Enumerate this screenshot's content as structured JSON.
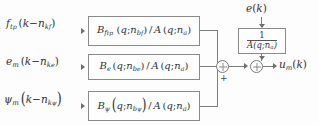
{
  "diagram": {
    "type": "block-diagram",
    "inputs": [
      {
        "name": "force-input",
        "latex": "f_{t_p}(k - n_{k_f})",
        "base": "f",
        "base_sub": "t",
        "base_sub2": "p",
        "arg_open": "(",
        "arg_var": "k",
        "minus": "−",
        "delay": "n",
        "delay_sub": "k",
        "delay_sub2": "f",
        "arg_close": ")"
      },
      {
        "name": "error-input",
        "latex": "e_m(k - n_{k_e})",
        "base": "e",
        "base_sub": "m",
        "base_sub2": "",
        "arg_open": "(",
        "arg_var": "k",
        "minus": "−",
        "delay": "n",
        "delay_sub": "k",
        "delay_sub2": "e",
        "arg_close": ")"
      },
      {
        "name": "psi-input",
        "latex": "ψ_m(k - n_{k_ψ})",
        "base": "ψ",
        "base_sub": "m",
        "base_sub2": "",
        "arg_open": "(",
        "arg_var": "k",
        "minus": "−",
        "delay": "n",
        "delay_sub": "k",
        "delay_sub2": "ψ",
        "arg_close": ")"
      }
    ],
    "blocks": [
      {
        "name": "block-Bf",
        "latex": "B_{f_{t_p}}(q;n_{b_f}) / A(q;n_a)",
        "num": "B",
        "num_sub": "f",
        "num_sub2": "t",
        "num_sub3": "p",
        "nb": "n",
        "nb_sub": "b",
        "nb_sub2": "f",
        "q": "q",
        "semi": ";",
        "slash": "/",
        "den": "A",
        "na": "n",
        "na_sub": "a"
      },
      {
        "name": "block-Be",
        "latex": "B_e(q;n_{b_e}) / A(q;n_a)",
        "num": "B",
        "num_sub": "e",
        "num_sub2": "",
        "num_sub3": "",
        "nb": "n",
        "nb_sub": "b",
        "nb_sub2": "e",
        "q": "q",
        "semi": ";",
        "slash": "/",
        "den": "A",
        "na": "n",
        "na_sub": "a"
      },
      {
        "name": "block-Bpsi",
        "latex": "B_ψ(q;n_{b_ψ}) / A(q;n_a)",
        "num": "B",
        "num_sub": "ψ",
        "num_sub2": "",
        "num_sub3": "",
        "nb": "n",
        "nb_sub": "b",
        "nb_sub2": "ψ",
        "q": "q",
        "semi": ";",
        "slash": "/",
        "den": "A",
        "na": "n",
        "na_sub": "a"
      }
    ],
    "noise_block": {
      "name": "block-inverse-A",
      "latex": "1 / A(q;n_a)",
      "numerator": "1",
      "denominator_base": "A",
      "denominator_args": "(q;n",
      "denominator_sub": "a",
      "denominator_close": ")"
    },
    "noise_input": {
      "name": "noise-ek",
      "latex": "e(k)",
      "base": "e",
      "open": "(",
      "var": "k",
      "close": ")"
    },
    "output": {
      "name": "output-um",
      "latex": "u_m(k)",
      "base": "u",
      "sub": "m",
      "open": "(",
      "var": "k",
      "close": ")"
    },
    "sum_junctions": [
      {
        "name": "sum-junction-1",
        "sign": "+"
      },
      {
        "name": "sum-junction-2",
        "sign": ""
      }
    ],
    "colors": {
      "background": "#fdfdfd",
      "block_border": "#8a8a8a",
      "wire": "#7d7d7d",
      "text": "#333333"
    }
  }
}
